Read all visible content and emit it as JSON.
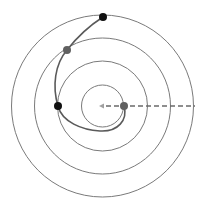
{
  "diagram": {
    "type": "concentric-circles-with-spiral-path",
    "center": [
      102.5,
      106
    ],
    "circles": [
      {
        "r": 21
      },
      {
        "r": 45
      },
      {
        "r": 68
      },
      {
        "r": 91
      }
    ],
    "circle_color": "#7a7a7a",
    "path_color": "#5a5a5a",
    "dashed_line": {
      "from": [
        103,
        106
      ],
      "to": [
        195,
        106
      ],
      "color": "#6a6a6a"
    },
    "arrow": {
      "at": [
        100,
        106
      ],
      "direction": "left",
      "color": "#9a9a9a"
    },
    "points": [
      {
        "x": 124,
        "y": 106,
        "color": "#606060"
      },
      {
        "x": 58,
        "y": 106,
        "color": "#111111"
      },
      {
        "x": 67,
        "y": 50,
        "color": "#606060"
      },
      {
        "x": 103,
        "y": 17,
        "color": "#111111"
      }
    ]
  }
}
